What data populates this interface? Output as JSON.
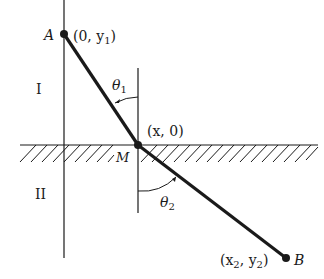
{
  "diagram": {
    "regions": {
      "upper": "I",
      "lower": "II"
    },
    "points": {
      "A": {
        "label": "A",
        "coords": "(0, y",
        "sub": "1",
        "close": ")"
      },
      "M": {
        "label": "M",
        "coords": "(x, 0)"
      },
      "B": {
        "label": "B",
        "coords_x": "(x",
        "sub_x": "2",
        "coords_mid": ", y",
        "sub_y": "2",
        "close": ")"
      }
    },
    "angles": {
      "theta1": {
        "symbol": "θ",
        "sub": "1"
      },
      "theta2": {
        "symbol": "θ",
        "sub": "2"
      }
    },
    "colors": {
      "ink": "#1a1a1a",
      "background": "#ffffff"
    }
  }
}
